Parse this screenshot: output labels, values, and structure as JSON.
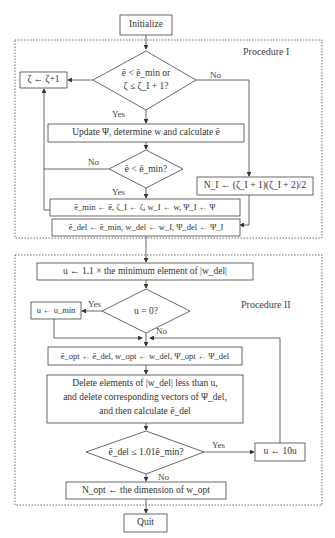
{
  "procedure_labels": {
    "p1": "Procedure I",
    "p2": "Procedure II"
  },
  "nodes": {
    "initialize": "Initialize",
    "zeta_inc": "ζ ← ζ+1",
    "cond1_line1": "ē < ē_min or",
    "cond1_line2": "ζ ≤ ζ_I + 1?",
    "update": "Update Ψ, determine w and calculate ē",
    "cond2": "ē < ē_min?",
    "n1": "N_I ← (ζ_I + 1)(ζ_I + 2)/2",
    "assign_min": "ē_min ← ē, ζ_I ← ζ, w_I ← w, Ψ_I ← Ψ",
    "assign_del": "ē_del ← ē_min, w_del ← w_I, Ψ_del ← Ψ_I",
    "u_init": "u ← 1.1 × the minimum element of |w_del|",
    "cond_u": "u = 0?",
    "u_min": "u ← u_min",
    "assign_opt": "ē_opt ← ē_del, w_opt ← w_del, Ψ_opt ← Ψ_del",
    "delete_line1": "Delete elements of |w_del| less than u,",
    "delete_line2": "and delete corresponding vectors of Ψ_del,",
    "delete_line3": "and then calculate ē_del",
    "cond3": "ē_del ≤ 1.01ē_min?",
    "u_10": "u ← 10u",
    "n_opt": "N_opt ← the dimension of w_opt",
    "quit": "Quit"
  },
  "edges": {
    "yes": "Yes",
    "no": "No"
  }
}
